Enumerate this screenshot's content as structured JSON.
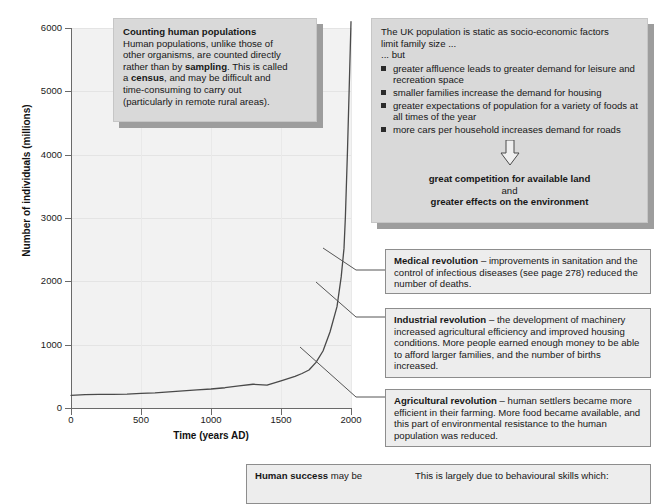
{
  "chart_data": {
    "type": "line",
    "title": "",
    "xlabel": "Time (years AD)",
    "ylabel": "Number of individuals (millions)",
    "xlim": [
      0,
      2000
    ],
    "ylim": [
      0,
      6000
    ],
    "xticks": [
      0,
      500,
      1000,
      1500,
      2000
    ],
    "yticks": [
      0,
      1000,
      2000,
      3000,
      4000,
      5000,
      6000
    ],
    "grid": true,
    "legend": "none",
    "series": [
      {
        "name": "Human population",
        "x": [
          0,
          100,
          200,
          300,
          400,
          500,
          600,
          700,
          800,
          900,
          1000,
          1100,
          1200,
          1300,
          1400,
          1500,
          1600,
          1650,
          1700,
          1750,
          1800,
          1850,
          1900,
          1930,
          1950,
          1960,
          1975,
          1990,
          2000
        ],
        "y": [
          200,
          210,
          215,
          215,
          220,
          230,
          240,
          255,
          270,
          285,
          300,
          320,
          350,
          375,
          360,
          430,
          500,
          545,
          600,
          720,
          900,
          1200,
          1600,
          2070,
          2520,
          3020,
          4070,
          5280,
          6100
        ]
      }
    ],
    "annotations": [
      {
        "label": "Agricultural revolution",
        "x": 1650,
        "y": 545
      },
      {
        "label": "Industrial revolution",
        "x": 1800,
        "y": 900
      },
      {
        "label": "Medical revolution",
        "x": 1880,
        "y": 1500
      }
    ]
  },
  "axis": {
    "y_title": "Number of individuals (millions)",
    "x_title": "Time (years AD)",
    "y_ticks": [
      "6000",
      "5000",
      "4000",
      "3000",
      "2000",
      "1000",
      "0"
    ],
    "x_ticks": [
      "0",
      "500",
      "1000",
      "1500",
      "2000"
    ]
  },
  "boxes": {
    "census": {
      "heading": "Counting human populations",
      "line1": "Human populations, unlike those of",
      "line2": "other organisms, are counted directly",
      "line3_a": "rather than by ",
      "line3_b": "sampling",
      "line3_c": ". This is called",
      "line4_a": "a ",
      "line4_b": "census",
      "line4_c": ", and may be difficult and",
      "line5": "time-consuming to carry out",
      "line6": "(particularly in remote rural areas)."
    },
    "uk": {
      "intro_line1": "The UK population is static as socio-economic factors",
      "intro_line2": "limit family size ...",
      "but": "... but",
      "bullets": [
        "greater affluence leads to greater demand for leisure and recreation space",
        "smaller families increase the demand for housing",
        "greater expectations of population for a variety of foods at all times of the year",
        "more cars per household increases demand for roads"
      ],
      "conclusion_line1": "great competition for available land",
      "conclusion_line2": "and",
      "conclusion_line3": "greater effects on the environment"
    },
    "medical": {
      "title": "Medical revolution",
      "dash": " – ",
      "body": "improvements in sanitation and the control of infectious diseases (see page 278) reduced the number of deaths."
    },
    "industrial": {
      "title": "Industrial revolution",
      "dash": " – ",
      "body": "the development of machinery increased agricultural efficiency and improved housing conditions. More people earned enough money to be able to afford larger families, and the number of births increased."
    },
    "agricultural": {
      "title": "Agricultural revolution",
      "dash": " – ",
      "body": "human settlers became more efficient in their farming. More food became available, and this part of environmental resistance to the human population was reduced."
    },
    "bottom": {
      "left_bold": "Human success",
      "left_rest": " may be",
      "right": "This is largely due to behavioural skills which:"
    }
  },
  "colors": {
    "plot_background": "#f2f2f2",
    "axis": "#6a6a6a",
    "curve": "#4a4a4a",
    "box_shadow_fill": "#d9d9d9",
    "box_shadow": "#9d9d9d",
    "box_plain_fill": "#ededed",
    "box_plain_border": "#8d8d8d",
    "text": "#171717"
  }
}
